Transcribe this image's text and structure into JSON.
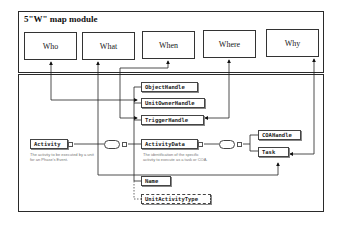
{
  "module": {
    "title": "5\"W\" map module",
    "boxes": [
      {
        "label": "Who"
      },
      {
        "label": "What"
      },
      {
        "label": "When"
      },
      {
        "label": "Where"
      },
      {
        "label": "Why"
      }
    ]
  },
  "schema": {
    "root": {
      "label": "Activity",
      "description": "The activity to be executed by a unit for an Phase's Event."
    },
    "children": [
      {
        "label": "ObjectHandle"
      },
      {
        "label": "UnitOwnerHandle"
      },
      {
        "label": "TriggerHandle"
      },
      {
        "label": "ActivityData",
        "description": "The identification of the specific activity to execute as a task or COA."
      },
      {
        "label": "Name"
      },
      {
        "label": "UnitActivityType",
        "optional": true
      }
    ],
    "activity_data_children": [
      {
        "label": "COAHandle"
      },
      {
        "label": "Task"
      }
    ]
  },
  "mappings": [
    {
      "from": "Who",
      "to": "UnitOwnerHandle"
    },
    {
      "from": "What",
      "to": "Task"
    },
    {
      "from": "When",
      "to": "TriggerHandle"
    },
    {
      "from": "Where",
      "to": "TriggerHandle"
    },
    {
      "from": "Why",
      "to": "Task"
    }
  ]
}
